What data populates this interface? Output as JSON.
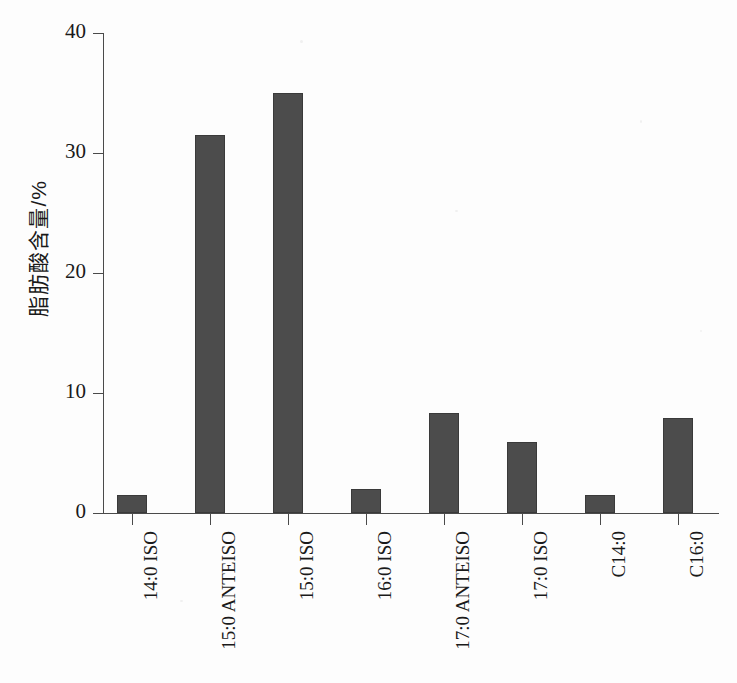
{
  "chart_data": {
    "type": "bar",
    "title": "",
    "xlabel": "",
    "ylabel": "脂肪酸含量/%",
    "ylim": [
      0,
      40
    ],
    "yticks": [
      0,
      10,
      20,
      30,
      40
    ],
    "grid": false,
    "legend": false,
    "bar_color": "#4c4c4c",
    "background_color": "#fdfdfd",
    "categories": [
      "14:0 ISO",
      "15:0 ANTEISO",
      "15:0 ISO",
      "16:0 ISO",
      "17:0 ANTEISO",
      "17:0 ISO",
      "C14:0",
      "C16:0"
    ],
    "values": [
      1.5,
      31.5,
      35.0,
      2.0,
      8.3,
      5.9,
      1.5,
      7.9
    ]
  }
}
